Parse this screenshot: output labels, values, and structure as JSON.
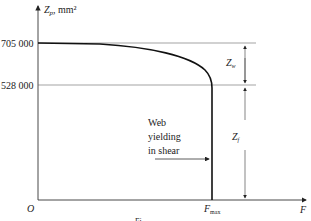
{
  "diagram": {
    "y_axis": {
      "symbol": "Z",
      "subscript": "p",
      "unit": ", mm²"
    },
    "x_axis": {
      "symbol": "F"
    },
    "origin": "O",
    "ticks": {
      "upper": "705 000",
      "lower": "528 000"
    },
    "dimensions": {
      "web": {
        "symbol": "Z",
        "subscript": "w"
      },
      "flange": {
        "symbol": "Z",
        "subscript": "f"
      }
    },
    "annotation": {
      "line1": "Web",
      "line2": "yielding",
      "line3": "in shear"
    },
    "fmax": {
      "symbol": "F",
      "subscript": "max"
    },
    "caption_fragment": "Fi"
  },
  "colors": {
    "line": "#222222",
    "thin": "#555555"
  }
}
